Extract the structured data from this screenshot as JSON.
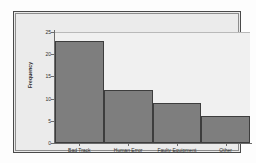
{
  "chart_data": {
    "type": "bar",
    "title": "",
    "xlabel": "",
    "ylabel": "Frequency",
    "categories": [
      "Bad Track",
      "Human Error",
      "Faulty Equipment",
      "Other"
    ],
    "values": [
      23,
      12,
      9,
      6
    ],
    "ylim": [
      0,
      25
    ],
    "yticks": [
      0,
      5,
      10,
      15,
      20,
      25
    ],
    "ytick_labels": [
      "0",
      "5",
      "10",
      "15",
      "20",
      "25"
    ],
    "grid": false,
    "legend": false,
    "orientation": "vertical",
    "bar_color": "#7e7e7e",
    "bar_edge_color": "#3d3d3d",
    "panel_color": "#f0f0f0",
    "frame_color": "#4a4a4a",
    "background": "#ebebeb",
    "text_color": "#2f2f2f"
  }
}
